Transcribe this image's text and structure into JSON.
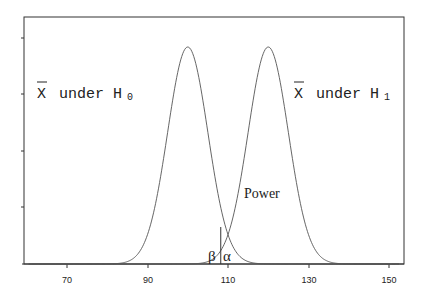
{
  "chart_data": {
    "type": "line",
    "title": "",
    "xlabel": "",
    "ylabel": "",
    "xlim": [
      60,
      153
    ],
    "x_ticks": [
      70,
      90,
      110,
      130,
      150
    ],
    "y_ticks_unlabeled": 5,
    "grid": false,
    "series": [
      {
        "name": "X̄ under H0",
        "distribution": "normal",
        "mean": 100,
        "sd": 5
      },
      {
        "name": "X̄ under H1",
        "distribution": "normal",
        "mean": 120,
        "sd": 5
      }
    ],
    "critical_value": 108.2,
    "annotations": [
      {
        "text": "Power",
        "x": 116,
        "region": "H1 curve right of cutoff"
      },
      {
        "text": "β",
        "region": "H1 tail left of cutoff"
      },
      {
        "text": "α",
        "region": "H0 tail right of cutoff"
      }
    ]
  },
  "labels": {
    "h0_label_x": "X",
    "h0_label_rest": "under H",
    "h0_sub": "0",
    "h1_label_x": "X",
    "h1_label_rest": "under H",
    "h1_sub": "1",
    "power": "Power",
    "beta": "β",
    "alpha": "α"
  },
  "ticks": {
    "t70": "70",
    "t90": "90",
    "t110": "110",
    "t130": "130",
    "t150": "150"
  }
}
